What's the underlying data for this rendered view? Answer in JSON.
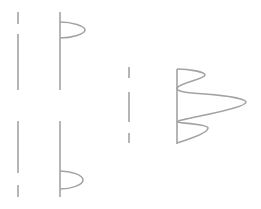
{
  "diagram": {
    "stroke_color": "#a3a3a3",
    "background": "#ffffff",
    "groups": [
      {
        "name": "top-left",
        "dashed_axis": {
          "segments": 2
        },
        "solid_axis": true,
        "waveform": {
          "bumps": 1,
          "relative_amplitudes": [
            1.0
          ]
        }
      },
      {
        "name": "bottom-left",
        "dashed_axis": {
          "segments": 2
        },
        "solid_axis": true,
        "waveform": {
          "bumps": 1,
          "relative_amplitudes": [
            0.9
          ]
        }
      },
      {
        "name": "right",
        "dashed_axis": {
          "segments": 3
        },
        "solid_axis": true,
        "waveform": {
          "bumps": 3,
          "relative_amplitudes": [
            0.4,
            1.0,
            0.45
          ]
        }
      }
    ]
  }
}
